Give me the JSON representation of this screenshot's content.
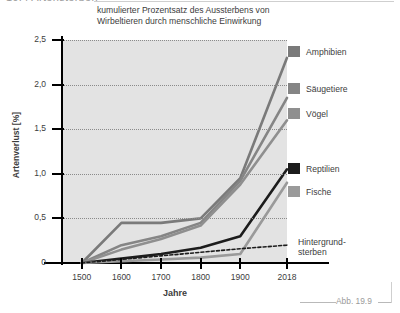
{
  "chapter": {
    "heading": "19.4 Artensterben"
  },
  "figure": {
    "caption": "Abb. 19.9"
  },
  "chart_data": {
    "type": "line",
    "title": "kumulierter Prozentsatz des Aussterbens von Wirbeltieren durch menschliche Einwirkung",
    "xlabel": "Jahre",
    "ylabel": "Artenverlust [%]",
    "xlim": [
      1450,
      2018
    ],
    "ylim": [
      0,
      2.5
    ],
    "grid": true,
    "legend_position": "right",
    "x_ticks": [
      "1500",
      "1600",
      "1700",
      "1800",
      "1900",
      "2018"
    ],
    "x_tick_values": [
      1500,
      1600,
      1700,
      1800,
      1900,
      2018
    ],
    "y_ticks": [
      "0",
      "0,5",
      "1,0",
      "1,5",
      "2,0",
      "2,5"
    ],
    "y_tick_values": [
      0,
      0.5,
      1.0,
      1.5,
      2.0,
      2.5
    ],
    "series": [
      {
        "name": "Amphibien",
        "color": "#7a7a7a",
        "x": [
          1500,
          1600,
          1700,
          1800,
          1900,
          2018
        ],
        "values": [
          0.0,
          0.45,
          0.45,
          0.5,
          0.95,
          2.3
        ]
      },
      {
        "name": "Säugetiere",
        "color": "#858585",
        "x": [
          1500,
          1600,
          1700,
          1800,
          1900,
          2018
        ],
        "values": [
          0.0,
          0.2,
          0.3,
          0.45,
          0.92,
          1.85
        ]
      },
      {
        "name": "Vögel",
        "color": "#8f8f8f",
        "x": [
          1500,
          1600,
          1700,
          1800,
          1900,
          2018
        ],
        "values": [
          0.0,
          0.15,
          0.27,
          0.42,
          0.88,
          1.6
        ]
      },
      {
        "name": "Reptilien",
        "color": "#1c1c1c",
        "x": [
          1500,
          1600,
          1700,
          1800,
          1900,
          2018
        ],
        "values": [
          0.0,
          0.05,
          0.1,
          0.17,
          0.3,
          1.05
        ]
      },
      {
        "name": "Fische",
        "color": "#9a9a9a",
        "x": [
          1500,
          1600,
          1700,
          1800,
          1900,
          2018
        ],
        "values": [
          0.0,
          0.02,
          0.04,
          0.06,
          0.1,
          0.9
        ]
      },
      {
        "name": "Hintergrundsterben",
        "color": "#1c1c1c",
        "style": "dashed",
        "x": [
          1500,
          1600,
          1700,
          1800,
          1900,
          2018
        ],
        "values": [
          0.0,
          0.04,
          0.08,
          0.12,
          0.16,
          0.2
        ]
      }
    ],
    "annotations": [
      {
        "name": "background-extinction",
        "label_line1": "Hintergrund-",
        "label_line2": "sterben"
      }
    ]
  },
  "legend": {
    "items": [
      {
        "label": "Amphibien",
        "color": "#7a7a7a"
      },
      {
        "label": "Säugetiere",
        "color": "#858585"
      },
      {
        "label": "Vögel",
        "color": "#8f8f8f"
      },
      {
        "label": "Reptilien",
        "color": "#1c1c1c"
      },
      {
        "label": "Fische",
        "color": "#9a9a9a"
      }
    ]
  }
}
